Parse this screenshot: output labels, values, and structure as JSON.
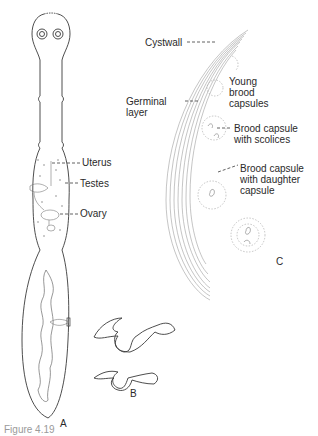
{
  "figure": {
    "caption_partial": "Figure 4.19",
    "panels": {
      "A": {
        "label": "A",
        "labels": {
          "uterus": "Uterus",
          "testes": "Testes",
          "ovary": "Ovary"
        }
      },
      "B": {
        "label": "B"
      },
      "C": {
        "label": "C",
        "labels": {
          "cystwall": "Cystwall",
          "germinal_layer_1": "Germinal",
          "germinal_layer_2": "layer",
          "young_brood_1": "Young",
          "young_brood_2": "brood",
          "young_brood_3": "capsules",
          "brood_scolices_1": "Brood capsule",
          "brood_scolices_2": "with scolices",
          "brood_daughter_1": "Brood capsule",
          "brood_daughter_2": "with daughter",
          "brood_daughter_3": "capsule"
        }
      }
    },
    "colors": {
      "ink": "#2a2a2a",
      "light_ink": "#8a8a8a",
      "background": "#ffffff"
    }
  }
}
